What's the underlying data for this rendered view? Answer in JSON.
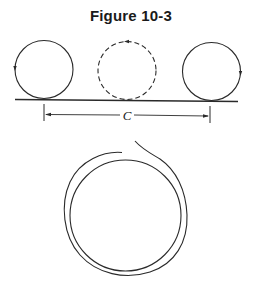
{
  "figure": {
    "title": "Figure 10-3",
    "dimension_label": "C",
    "circles": [
      {
        "name": "start-position",
        "style": "solid",
        "arrow": "left side, pointing down"
      },
      {
        "name": "mid-position",
        "style": "dashed",
        "arrow": "top, pointing left"
      },
      {
        "name": "end-position",
        "style": "solid",
        "arrow": "right side, pointing down"
      }
    ],
    "lower_figure": "coiled wire loop (double strand)",
    "colors": {
      "ink": "#2a2a2a",
      "background": "#ffffff"
    }
  }
}
